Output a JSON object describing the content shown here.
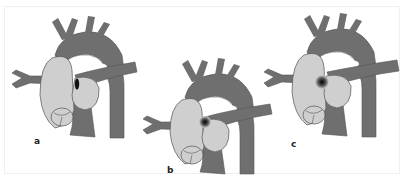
{
  "figure": {
    "panels": [
      {
        "id": "a",
        "label": "a",
        "shunt": "eccentric dark ellipse on right atrial septum"
      },
      {
        "id": "b",
        "label": "b",
        "shunt": "central gradient spot"
      },
      {
        "id": "c",
        "label": "c",
        "shunt": "gradient spot at upper septum"
      }
    ]
  },
  "colors": {
    "vessel": "#6f6f6f",
    "chamber": "#cfcfcf",
    "outline": "#555555",
    "background": "#ffffff",
    "defect": "#111111"
  }
}
